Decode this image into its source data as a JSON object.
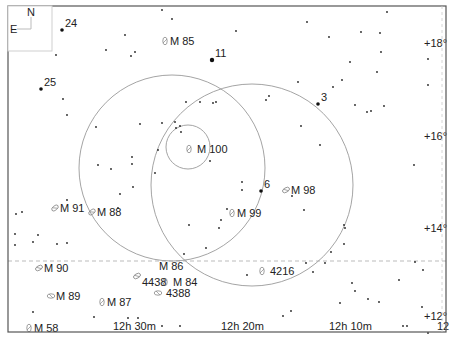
{
  "compass": {
    "north": "N",
    "east": "E"
  },
  "frame": {
    "left": 8,
    "top": 6,
    "right": 446,
    "bottom": 332
  },
  "ra_labels": [
    {
      "text": "12h 30m",
      "x": 113,
      "y": 330
    },
    {
      "text": "12h 20m",
      "x": 221,
      "y": 330
    },
    {
      "text": "12h 10m",
      "x": 329,
      "y": 330
    },
    {
      "text": "12",
      "x": 437,
      "y": 330
    }
  ],
  "dec_labels": [
    {
      "text": "+18°",
      "x": 424,
      "y": 47
    },
    {
      "text": "+16°",
      "x": 424,
      "y": 140
    },
    {
      "text": "+14°",
      "x": 424,
      "y": 232
    },
    {
      "text": "+12°",
      "x": 424,
      "y": 320
    }
  ],
  "dashed_line_y": 261,
  "circles": [
    {
      "name": "field-circle-large-1",
      "cx": 172,
      "cy": 168,
      "r": 93
    },
    {
      "name": "field-circle-large-2",
      "cx": 252,
      "cy": 185,
      "r": 101
    },
    {
      "name": "field-circle-small",
      "cx": 188,
      "cy": 147,
      "r": 22
    }
  ],
  "numbered_stars": [
    {
      "label": "24",
      "x": 62,
      "y": 30,
      "size": 1.8
    },
    {
      "label": "25",
      "x": 41,
      "y": 89,
      "size": 1.8
    },
    {
      "label": "11",
      "x": 212,
      "y": 60,
      "size": 2.2
    },
    {
      "label": "3",
      "x": 318,
      "y": 104,
      "size": 1.8
    },
    {
      "label": "6",
      "x": 261,
      "y": 191,
      "size": 1.8
    }
  ],
  "galaxies": [
    {
      "label": "M 85",
      "x": 165,
      "y": 41,
      "rot": 0
    },
    {
      "label": "M 100",
      "x": 189,
      "y": 149,
      "rot": 0
    },
    {
      "label": "M 98",
      "x": 286,
      "y": 190,
      "rot": 60
    },
    {
      "label": "M 99",
      "x": 232,
      "y": 213,
      "rot": 0
    },
    {
      "label": "M 91",
      "x": 55,
      "y": 208,
      "rot": 50
    },
    {
      "label": "M 88",
      "x": 92,
      "y": 212,
      "rot": 50
    },
    {
      "label": "M 90",
      "x": 39,
      "y": 268,
      "rot": 60
    },
    {
      "label": "M 89",
      "x": 51,
      "y": 296,
      "rot": 90
    },
    {
      "label": "M 87",
      "x": 102,
      "y": 302,
      "rot": 0
    },
    {
      "label": "M 58",
      "x": 29,
      "y": 328,
      "rot": 0
    },
    {
      "label": "M 86",
      "x": 137,
      "y": 276,
      "rot": 60
    },
    {
      "label": "M 84",
      "x": 165,
      "y": 282,
      "rot": 0
    },
    {
      "label": "4438",
      "x": 165,
      "y": 282,
      "rot": 0
    },
    {
      "label": "4388",
      "x": 158,
      "y": 293,
      "rot": 90
    },
    {
      "label": "4216",
      "x": 262,
      "y": 271,
      "rot": 0
    }
  ],
  "stars": [
    [
      162,
      10
    ],
    [
      172,
      19
    ],
    [
      387,
      12
    ],
    [
      125,
      35
    ],
    [
      135,
      52
    ],
    [
      56,
      55
    ],
    [
      236,
      31
    ],
    [
      131,
      56
    ],
    [
      106,
      50
    ],
    [
      307,
      22
    ],
    [
      361,
      32
    ],
    [
      329,
      37
    ],
    [
      380,
      33
    ],
    [
      381,
      52
    ],
    [
      350,
      62
    ],
    [
      377,
      72
    ],
    [
      342,
      80
    ],
    [
      333,
      87
    ],
    [
      371,
      111
    ],
    [
      367,
      112
    ],
    [
      428,
      59
    ],
    [
      428,
      85
    ],
    [
      266,
      100
    ],
    [
      269,
      96
    ],
    [
      298,
      82
    ],
    [
      355,
      105
    ],
    [
      200,
      102
    ],
    [
      186,
      102
    ],
    [
      216,
      102
    ],
    [
      180,
      126
    ],
    [
      175,
      122
    ],
    [
      162,
      123
    ],
    [
      176,
      128
    ],
    [
      213,
      103
    ],
    [
      181,
      132
    ],
    [
      158,
      150
    ],
    [
      140,
      124
    ],
    [
      67,
      115
    ],
    [
      63,
      99
    ],
    [
      96,
      127
    ],
    [
      98,
      165
    ],
    [
      132,
      157
    ],
    [
      132,
      164
    ],
    [
      133,
      187
    ],
    [
      120,
      194
    ],
    [
      111,
      169
    ],
    [
      118,
      208
    ],
    [
      155,
      173
    ],
    [
      210,
      161
    ],
    [
      242,
      182
    ],
    [
      242,
      190
    ],
    [
      227,
      209
    ],
    [
      221,
      220
    ],
    [
      219,
      228
    ],
    [
      301,
      126
    ],
    [
      320,
      145
    ],
    [
      384,
      106
    ],
    [
      344,
      225
    ],
    [
      344,
      244
    ],
    [
      414,
      165
    ],
    [
      22,
      212
    ],
    [
      16,
      214
    ],
    [
      33,
      242
    ],
    [
      15,
      245
    ],
    [
      38,
      235
    ],
    [
      15,
      234
    ],
    [
      67,
      200
    ],
    [
      67,
      243
    ],
    [
      57,
      244
    ],
    [
      189,
      225
    ],
    [
      184,
      254
    ],
    [
      206,
      248
    ],
    [
      292,
      196
    ],
    [
      304,
      210
    ],
    [
      399,
      280
    ],
    [
      379,
      302
    ],
    [
      291,
      311
    ],
    [
      247,
      275
    ],
    [
      306,
      263
    ],
    [
      352,
      283
    ],
    [
      355,
      291
    ],
    [
      325,
      263
    ],
    [
      313,
      272
    ],
    [
      422,
      307
    ],
    [
      423,
      270
    ],
    [
      428,
      333
    ],
    [
      407,
      326
    ],
    [
      415,
      262
    ],
    [
      331,
      252
    ],
    [
      345,
      228
    ],
    [
      340,
      303
    ],
    [
      368,
      299
    ],
    [
      33,
      312
    ],
    [
      94,
      317
    ],
    [
      128,
      318
    ],
    [
      138,
      318
    ],
    [
      162,
      326
    ],
    [
      180,
      326
    ],
    [
      283,
      316
    ],
    [
      345,
      329
    ],
    [
      403,
      326
    ]
  ]
}
